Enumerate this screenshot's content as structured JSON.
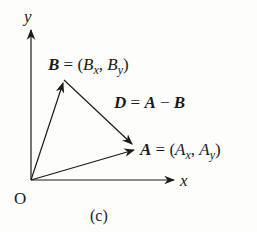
{
  "diagram": {
    "axes": {
      "x_label": "x",
      "y_label": "y",
      "origin_label": "O"
    },
    "vectors": {
      "B": {
        "name": "B",
        "eq": " = (",
        "c1": "B",
        "s1": "x",
        "comma": ", ",
        "c2": "B",
        "s2": "y",
        "close": ")"
      },
      "A": {
        "name": "A",
        "eq": " = (",
        "c1": "A",
        "s1": "x",
        "comma": ", ",
        "c2": "A",
        "s2": "y",
        "close": ")"
      },
      "D": {
        "name": "D",
        "eq": " = ",
        "a": "A",
        "minus": " − ",
        "b": "B"
      }
    },
    "caption": "(c)",
    "colors": {
      "ink": "#1a1a1a",
      "background": "#fdfdfb"
    }
  }
}
